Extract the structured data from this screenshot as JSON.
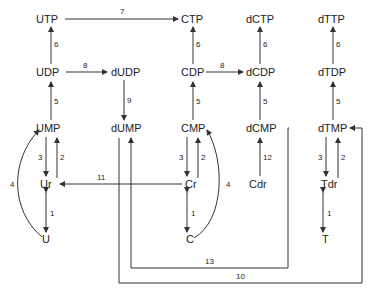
{
  "nodes": {
    "UTP": "UTP",
    "CTP": "CTP",
    "dCTP": "dCTP",
    "dTTP": "dTTP",
    "UDP": "UDP",
    "dUDP": "dUDP",
    "CDP": "CDP",
    "dCDP": "dCDP",
    "dTDP": "dTDP",
    "UMP": "UMP",
    "dUMP": "dUMP",
    "CMP": "CMP",
    "dCMP": "dCMP",
    "dTMP": "dTMP",
    "Ur": "Ur",
    "Cr": "Cr",
    "Cdr": "Cdr",
    "Tdr": "Tdr",
    "U": "U",
    "C": "C",
    "T": "T"
  },
  "edges": {
    "e7": "7",
    "e6a": "6",
    "e6b": "6",
    "e6c": "6",
    "e6d": "6",
    "e8a": "8",
    "e8b": "8",
    "e9": "9",
    "e5a": "5",
    "e5b": "5",
    "e5c": "5",
    "e5d": "5",
    "e3a": "3",
    "e2a": "2",
    "e3b": "3",
    "e2b": "2",
    "e3c": "3",
    "e2c": "2",
    "e4a": "4",
    "e4b": "4",
    "e11": "11",
    "e12": "12",
    "e1a": "1",
    "e1b": "1",
    "e1c": "1",
    "e13": "13",
    "e10": "10"
  }
}
